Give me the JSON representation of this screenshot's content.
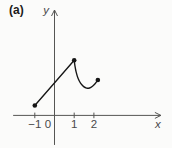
{
  "figure": {
    "background": "#fbfbfa",
    "ink_color": "#161616",
    "axis_color": "#555553",
    "label_color": "#49494a"
  },
  "chart_data": {
    "type": "line",
    "panel_label": "(a)",
    "title": "(a)",
    "xlabel": "x",
    "ylabel": "y",
    "grid": false,
    "legend": "none",
    "xlim": [
      -2.1,
      5.4
    ],
    "ylim": [
      -1.5,
      5.35
    ],
    "x_ticks": [
      {
        "value": -1,
        "label": "−1"
      },
      {
        "value": 1,
        "label": "1"
      },
      {
        "value": 2,
        "label": "2"
      }
    ],
    "origin_label": "0",
    "series": [
      {
        "name": "line-segment",
        "points": [
          [
            -1,
            0.5
          ],
          [
            1,
            2.8
          ]
        ]
      },
      {
        "name": "curve",
        "points": [
          [
            1,
            2.8
          ],
          [
            1.04,
            2.5
          ],
          [
            1.1,
            2.2
          ],
          [
            1.2,
            1.87
          ],
          [
            1.33,
            1.62
          ],
          [
            1.48,
            1.46
          ],
          [
            1.63,
            1.385
          ],
          [
            1.78,
            1.39
          ],
          [
            1.93,
            1.48
          ],
          [
            2.07,
            1.62
          ],
          [
            2.2,
            1.8
          ]
        ]
      }
    ],
    "marked_points": [
      [
        -1,
        0.5
      ],
      [
        1,
        2.8
      ],
      [
        2.2,
        1.8
      ]
    ]
  }
}
